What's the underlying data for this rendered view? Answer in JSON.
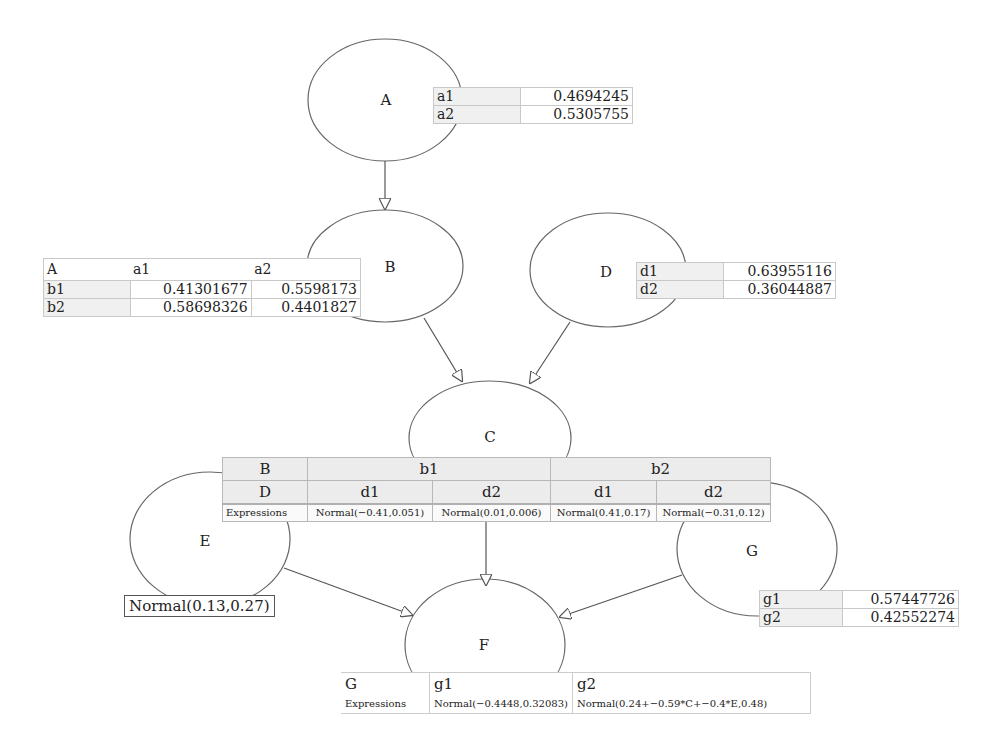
{
  "nodes": {
    "A": {
      "label": "A"
    },
    "B": {
      "label": "B"
    },
    "C": {
      "label": "C"
    },
    "D": {
      "label": "D"
    },
    "E": {
      "label": "E"
    },
    "F": {
      "label": "F"
    },
    "G": {
      "label": "G"
    }
  },
  "edges": [
    {
      "from": "A",
      "to": "B"
    },
    {
      "from": "B",
      "to": "C"
    },
    {
      "from": "D",
      "to": "C"
    },
    {
      "from": "C",
      "to": "F"
    },
    {
      "from": "E",
      "to": "F"
    },
    {
      "from": "G",
      "to": "F"
    }
  ],
  "cpt_A": {
    "rows": [
      {
        "state": "a1",
        "value": "0.4694245"
      },
      {
        "state": "a2",
        "value": "0.5305755"
      }
    ]
  },
  "cpt_B": {
    "header": {
      "parent": "A",
      "col1": "a1",
      "col2": "a2"
    },
    "rows": [
      {
        "state": "b1",
        "v1": "0.41301677",
        "v2": "0.5598173"
      },
      {
        "state": "b2",
        "v1": "0.58698326",
        "v2": "0.4401827"
      }
    ]
  },
  "cpt_D": {
    "rows": [
      {
        "state": "d1",
        "value": "0.63955116"
      },
      {
        "state": "d2",
        "value": "0.36044887"
      }
    ]
  },
  "cpt_C": {
    "row1": {
      "label": "B",
      "b1": "b1",
      "b2": "b2"
    },
    "row2": {
      "label": "D",
      "c1": "d1",
      "c2": "d2",
      "c3": "d1",
      "c4": "d2"
    },
    "row3": {
      "label": "Expressions",
      "c1": "Normal(−0.41,0.051)",
      "c2": "Normal(0.01,0.006)",
      "c3": "Normal(0.41,0.17)",
      "c4": "Normal(−0.31,0.12)"
    }
  },
  "cpt_E": {
    "expression": "Normal(0.13,0.27)"
  },
  "cpt_G": {
    "rows": [
      {
        "state": "g1",
        "value": "0.57447726"
      },
      {
        "state": "g2",
        "value": "0.42552274"
      }
    ]
  },
  "cpt_F": {
    "header": {
      "parent": "G",
      "col1": "g1",
      "col2": "g2"
    },
    "expr": {
      "label": "Expressions",
      "c1": "Normal(−0.4448,0.32083)",
      "c2": "Normal(0.24+−0.59*C+−0.4*E,0.48)"
    }
  }
}
